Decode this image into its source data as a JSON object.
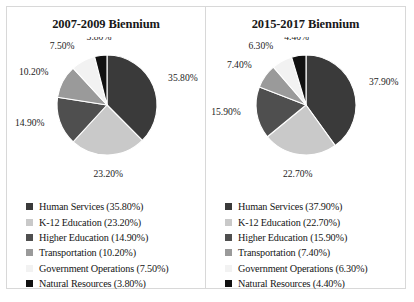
{
  "figure": {
    "panels": [
      {
        "id": "biennium-2007-2009",
        "title": "2007-2009 Biennium",
        "chart_data": {
          "type": "pie",
          "title": "2007-2009 Biennium",
          "categories": [
            "Human Services",
            "K-12 Education",
            "Higher Education",
            "Transportation",
            "Government Operations",
            "Natural Resources"
          ],
          "values": [
            35.8,
            23.2,
            14.9,
            10.2,
            7.5,
            3.8
          ],
          "value_labels": [
            "35.80%",
            "23.20%",
            "14.90%",
            "10.20%",
            "7.50%",
            "3.80%"
          ],
          "colors": [
            "#3a3a3a",
            "#c9c9c9",
            "#4f4f4f",
            "#9a9a9a",
            "#f2f2f2",
            "#111111"
          ],
          "legend": [
            "Human Services (35.80%)",
            "K-12 Education (23.20%)",
            "Higher Education (14.90%)",
            "Transportation (10.20%)",
            "Government Operations (7.50%)",
            "Natural Resources (3.80%)"
          ],
          "legend_position": "bottom",
          "start_angle_deg": 0,
          "direction": "clockwise",
          "grid": false,
          "xlabel": "",
          "ylabel": ""
        }
      },
      {
        "id": "biennium-2015-2017",
        "title": "2015-2017 Biennium",
        "chart_data": {
          "type": "pie",
          "title": "2015-2017 Biennium",
          "categories": [
            "Human Services",
            "K-12 Education",
            "Higher Education",
            "Transportation",
            "Government Operations",
            "Natural Resources"
          ],
          "values": [
            37.9,
            22.7,
            15.9,
            7.4,
            6.3,
            4.4
          ],
          "value_labels": [
            "37.90%",
            "22.70%",
            "15.90%",
            "7.40%",
            "6.30%",
            "4.40%"
          ],
          "colors": [
            "#3a3a3a",
            "#c9c9c9",
            "#4f4f4f",
            "#9a9a9a",
            "#f2f2f2",
            "#111111"
          ],
          "legend": [
            "Human Services (37.90%)",
            "K-12 Education (22.70%)",
            "Higher Education (15.90%)",
            "Transportation (7.40%)",
            "Government Operations (6.30%)",
            "Natural Resources (4.40%)"
          ],
          "legend_position": "bottom",
          "start_angle_deg": 0,
          "direction": "clockwise",
          "grid": false,
          "xlabel": "",
          "ylabel": ""
        }
      }
    ]
  },
  "chart_data": [
    {
      "type": "pie",
      "title": "2007-2009 Biennium",
      "categories": [
        "Human Services",
        "K-12 Education",
        "Higher Education",
        "Transportation",
        "Government Operations",
        "Natural Resources"
      ],
      "values": [
        35.8,
        23.2,
        14.9,
        10.2,
        7.5,
        3.8
      ],
      "colors": [
        "#3a3a3a",
        "#c9c9c9",
        "#4f4f4f",
        "#9a9a9a",
        "#f2f2f2",
        "#111111"
      ],
      "legend_position": "bottom",
      "grid": false
    },
    {
      "type": "pie",
      "title": "2015-2017 Biennium",
      "categories": [
        "Human Services",
        "K-12 Education",
        "Higher Education",
        "Transportation",
        "Government Operations",
        "Natural Resources"
      ],
      "values": [
        37.9,
        22.7,
        15.9,
        7.4,
        6.3,
        4.4
      ],
      "colors": [
        "#3a3a3a",
        "#c9c9c9",
        "#4f4f4f",
        "#9a9a9a",
        "#f2f2f2",
        "#111111"
      ],
      "legend_position": "bottom",
      "grid": false
    }
  ]
}
